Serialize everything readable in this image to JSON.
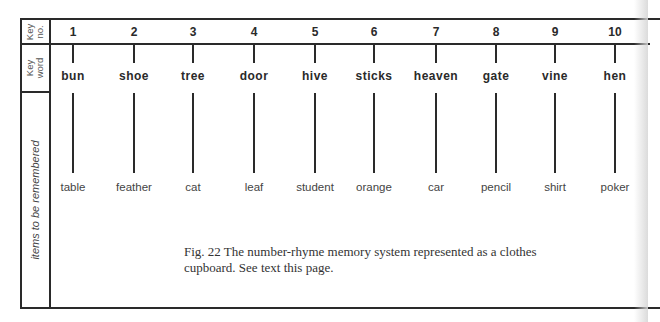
{
  "row_labels": {
    "key_no": "Key no.",
    "key_word": "Key word",
    "items": "items to be remembered"
  },
  "columns": [
    {
      "num": "1",
      "keyword": "bun",
      "item": "table",
      "x": 73
    },
    {
      "num": "2",
      "keyword": "shoe",
      "item": "feather",
      "x": 134
    },
    {
      "num": "3",
      "keyword": "tree",
      "item": "cat",
      "x": 193
    },
    {
      "num": "4",
      "keyword": "door",
      "item": "leaf",
      "x": 254
    },
    {
      "num": "5",
      "keyword": "hive",
      "item": "student",
      "x": 315
    },
    {
      "num": "6",
      "keyword": "sticks",
      "item": "orange",
      "x": 374
    },
    {
      "num": "7",
      "keyword": "heaven",
      "item": "car",
      "x": 436
    },
    {
      "num": "8",
      "keyword": "gate",
      "item": "pencil",
      "x": 496
    },
    {
      "num": "9",
      "keyword": "vine",
      "item": "shirt",
      "x": 555
    },
    {
      "num": "10",
      "keyword": "hen",
      "item": "poker",
      "x": 615
    }
  ],
  "caption": {
    "line1": "Fig. 22 The number-rhyme memory system represented as a clothes",
    "line2": "cupboard. See text this page."
  }
}
